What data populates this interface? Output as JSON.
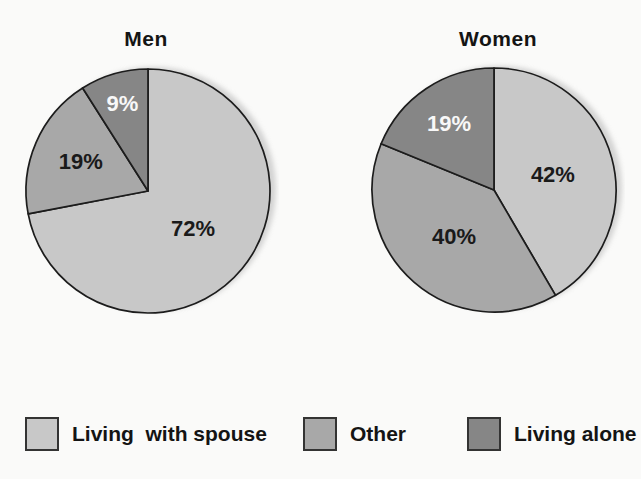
{
  "colors": {
    "light": "#c8c8c8",
    "medium": "#a8a8a8",
    "dark": "#868686",
    "stroke": "#1c1c1c"
  },
  "chart_data": [
    {
      "type": "pie",
      "title": "Men",
      "labels": [
        "Living with spouse",
        "Other",
        "Living alone"
      ],
      "values": [
        72,
        19,
        9
      ],
      "display_values": [
        "72%",
        "19%",
        "9%"
      ],
      "color_keys": [
        "light",
        "medium",
        "dark"
      ],
      "label_colors": [
        "#1a1a1a",
        "#1a1a1a",
        "#f8f8f8"
      ],
      "label_radii": [
        0.48,
        0.6,
        0.75
      ],
      "start_angle_deg": 0,
      "direction": "clockwise"
    },
    {
      "type": "pie",
      "title": "Women",
      "labels": [
        "Living with spouse",
        "Other",
        "Living alone"
      ],
      "values": [
        42,
        40,
        19
      ],
      "display_values": [
        "42%",
        "40%",
        "19%"
      ],
      "color_keys": [
        "light",
        "medium",
        "dark"
      ],
      "label_colors": [
        "#1a1a1a",
        "#1a1a1a",
        "#f8f8f8"
      ],
      "label_radii": [
        0.5,
        0.5,
        0.66
      ],
      "start_angle_deg": 0,
      "direction": "clockwise"
    }
  ],
  "legend": [
    {
      "label": "Living  with spouse",
      "color_key": "light"
    },
    {
      "label": "Other",
      "color_key": "medium"
    },
    {
      "label": "Living alone",
      "color_key": "dark"
    }
  ]
}
